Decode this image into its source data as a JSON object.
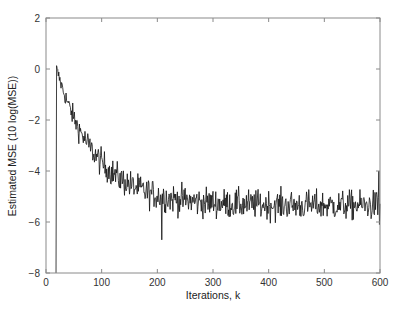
{
  "chart_data": {
    "type": "line",
    "title": "",
    "xlabel": "Iterations, k",
    "ylabel": "Estimated MSE  (10 log(MSE))",
    "xlim": [
      0,
      600
    ],
    "ylim": [
      -8,
      2
    ],
    "xticks": [
      0,
      100,
      200,
      300,
      400,
      500,
      600
    ],
    "yticks": [
      -8,
      -6,
      -4,
      -2,
      0,
      2
    ],
    "xtick_labels": [
      "0",
      "100",
      "200",
      "300",
      "400",
      "500",
      "600"
    ],
    "ytick_labels": [
      "−8",
      "−6",
      "−4",
      "−2",
      "0",
      "2"
    ],
    "grid": false,
    "legend": null,
    "series": [
      {
        "name": "Estimated MSE",
        "color": "#111111",
        "start_k": 18,
        "start_from_value": -8,
        "description": "Noisy learning curve: rises vertically at k≈18 from -8 to ~0.1 dB, decays roughly exponentially, then fluctuates around -5.3 dB with ±0.6 dB noise.",
        "sampled_points": {
          "x": [
            18,
            20,
            30,
            40,
            50,
            60,
            70,
            80,
            90,
            100,
            120,
            140,
            160,
            180,
            200,
            208,
            220,
            250,
            300,
            350,
            400,
            450,
            500,
            550,
            590,
            598,
            600
          ],
          "y": [
            -8.0,
            0.1,
            -0.4,
            -1.0,
            -1.6,
            -2.3,
            -2.6,
            -3.0,
            -3.3,
            -3.5,
            -4.0,
            -4.4,
            -4.8,
            -5.0,
            -5.2,
            -6.7,
            -5.1,
            -5.3,
            -5.2,
            -5.4,
            -5.3,
            -5.5,
            -5.3,
            -5.4,
            -5.5,
            -4.0,
            -6.1
          ]
        },
        "model": {
          "initial_db": 0.0,
          "steady_state_db": -5.35,
          "time_constant_k": 70,
          "noise_amplitude_db": 0.55
        },
        "spikes": [
          {
            "k": 208,
            "value": -6.7
          },
          {
            "k": 598,
            "value": -4.0
          },
          {
            "k": 599,
            "value": -6.1
          }
        ]
      }
    ]
  },
  "axes": {
    "frame_color": "#8a8a8a",
    "line_color": "#111111"
  }
}
